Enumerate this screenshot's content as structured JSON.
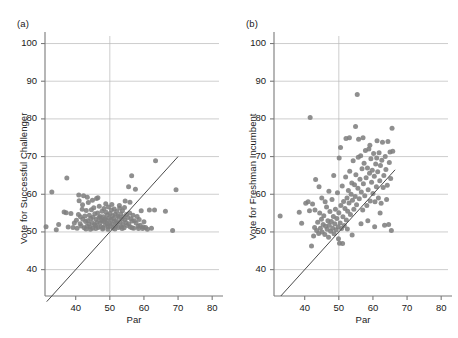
{
  "figure": {
    "background": "#ffffff",
    "marker_color": "#808080",
    "grid_color": "#b9b9b9",
    "axis_color": "#7a7a7a",
    "line_color": "#4a4a4a"
  },
  "panels": [
    {
      "tag": "(a)",
      "chart_data": {
        "type": "scatter",
        "title": "",
        "xlabel": "Par",
        "ylabel": "Vote for Successful Challenger",
        "xlim": [
          31,
          82
        ],
        "ylim": [
          33,
          102
        ],
        "xticks": [
          40,
          50,
          60,
          70,
          80
        ],
        "yticks": [
          40,
          50,
          60,
          70,
          80,
          90,
          100
        ],
        "grid": "horizontal-gridlines-at-yticks plus vertical gridline at x=50",
        "legend": "none",
        "reference_line": {
          "name": "identity-line",
          "equation": "y = x",
          "x_from": 31.5,
          "y_from": 31.5,
          "x_to": 70.0,
          "y_to": 70.0
        },
        "points": [
          [
            31.3,
            51.4
          ],
          [
            33.0,
            60.6
          ],
          [
            34.3,
            50.6
          ],
          [
            36.6,
            55.3
          ],
          [
            37.2,
            55.1
          ],
          [
            37.4,
            64.3
          ],
          [
            38.6,
            54.9
          ],
          [
            39.2,
            51.2
          ],
          [
            39.6,
            52.4
          ],
          [
            40.2,
            53.1
          ],
          [
            40.4,
            51.0
          ],
          [
            40.8,
            54.6
          ],
          [
            41.0,
            58.3
          ],
          [
            41.3,
            52.2
          ],
          [
            41.6,
            51.6
          ],
          [
            41.9,
            56.0
          ],
          [
            42.1,
            53.4
          ],
          [
            42.3,
            59.6
          ],
          [
            42.5,
            51.1
          ],
          [
            42.7,
            54.2
          ],
          [
            42.9,
            52.8
          ],
          [
            43.1,
            55.7
          ],
          [
            43.3,
            51.5
          ],
          [
            43.5,
            53.0
          ],
          [
            43.7,
            57.8
          ],
          [
            43.9,
            52.1
          ],
          [
            44.0,
            54.4
          ],
          [
            44.2,
            51.3
          ],
          [
            44.4,
            53.6
          ],
          [
            44.6,
            55.9
          ],
          [
            44.8,
            52.5
          ],
          [
            45.0,
            51.0
          ],
          [
            45.1,
            53.9
          ],
          [
            45.3,
            56.4
          ],
          [
            45.5,
            52.0
          ],
          [
            45.6,
            54.8
          ],
          [
            45.8,
            51.7
          ],
          [
            46.0,
            53.3
          ],
          [
            46.1,
            58.9
          ],
          [
            46.3,
            52.6
          ],
          [
            46.4,
            55.0
          ],
          [
            46.6,
            51.2
          ],
          [
            46.8,
            53.8
          ],
          [
            46.9,
            56.8
          ],
          [
            47.1,
            52.3
          ],
          [
            47.2,
            54.1
          ],
          [
            47.4,
            51.4
          ],
          [
            47.5,
            53.2
          ],
          [
            47.7,
            55.5
          ],
          [
            47.8,
            52.9
          ],
          [
            48.0,
            51.1
          ],
          [
            48.1,
            54.0
          ],
          [
            48.3,
            56.2
          ],
          [
            48.4,
            52.7
          ],
          [
            48.6,
            53.5
          ],
          [
            48.7,
            51.8
          ],
          [
            48.9,
            55.2
          ],
          [
            49.0,
            53.1
          ],
          [
            49.2,
            52.2
          ],
          [
            49.3,
            54.5
          ],
          [
            49.5,
            51.3
          ],
          [
            49.6,
            56.6
          ],
          [
            49.8,
            53.7
          ],
          [
            49.9,
            52.4
          ],
          [
            50.1,
            54.9
          ],
          [
            50.2,
            51.5
          ],
          [
            50.4,
            53.3
          ],
          [
            50.5,
            55.8
          ],
          [
            50.7,
            52.1
          ],
          [
            50.8,
            54.3
          ],
          [
            51.0,
            51.0
          ],
          [
            51.1,
            53.6
          ],
          [
            51.3,
            56.1
          ],
          [
            51.4,
            52.8
          ],
          [
            51.6,
            54.7
          ],
          [
            51.7,
            51.6
          ],
          [
            51.9,
            53.0
          ],
          [
            52.0,
            55.4
          ],
          [
            52.2,
            52.3
          ],
          [
            52.3,
            54.2
          ],
          [
            52.5,
            51.2
          ],
          [
            52.7,
            53.9
          ],
          [
            52.8,
            57.0
          ],
          [
            53.0,
            52.6
          ],
          [
            53.2,
            54.8
          ],
          [
            53.3,
            51.4
          ],
          [
            53.5,
            53.4
          ],
          [
            53.7,
            55.6
          ],
          [
            53.8,
            52.0
          ],
          [
            54.0,
            54.0
          ],
          [
            54.2,
            51.1
          ],
          [
            54.4,
            53.2
          ],
          [
            54.5,
            58.2
          ],
          [
            54.7,
            52.5
          ],
          [
            54.9,
            54.6
          ],
          [
            55.1,
            51.7
          ],
          [
            55.3,
            53.8
          ],
          [
            55.5,
            62.0
          ],
          [
            55.6,
            52.2
          ],
          [
            55.8,
            55.0
          ],
          [
            56.0,
            51.3
          ],
          [
            56.2,
            53.5
          ],
          [
            56.4,
            64.9
          ],
          [
            56.6,
            52.9
          ],
          [
            56.8,
            54.4
          ],
          [
            57.0,
            51.0
          ],
          [
            57.2,
            53.0
          ],
          [
            57.5,
            61.3
          ],
          [
            57.7,
            52.4
          ],
          [
            58.0,
            54.1
          ],
          [
            58.3,
            51.5
          ],
          [
            58.6,
            53.3
          ],
          [
            58.9,
            51.8
          ],
          [
            59.2,
            55.6
          ],
          [
            59.6,
            50.9
          ],
          [
            60.0,
            52.7
          ],
          [
            60.5,
            51.2
          ],
          [
            61.0,
            50.7
          ],
          [
            61.6,
            55.8
          ],
          [
            62.2,
            51.0
          ],
          [
            63.1,
            55.8
          ],
          [
            63.4,
            68.9
          ],
          [
            66.3,
            55.5
          ],
          [
            68.4,
            50.4
          ],
          [
            69.4,
            61.2
          ],
          [
            35.0,
            52.0
          ],
          [
            37.8,
            51.3
          ],
          [
            40.9,
            59.8
          ],
          [
            42.0,
            57.2
          ],
          [
            43.4,
            59.2
          ],
          [
            44.9,
            58.4
          ],
          [
            46.5,
            59.1
          ],
          [
            48.8,
            57.5
          ],
          [
            50.6,
            57.3
          ],
          [
            52.9,
            56.3
          ],
          [
            54.3,
            56.5
          ],
          [
            55.9,
            57.9
          ],
          [
            41.4,
            54.0
          ],
          [
            45.9,
            50.9
          ],
          [
            47.9,
            50.8
          ],
          [
            49.4,
            50.7
          ],
          [
            51.5,
            50.8
          ],
          [
            53.6,
            50.9
          ],
          [
            56.5,
            51.1
          ],
          [
            58.4,
            50.9
          ],
          [
            59.8,
            51.3
          ],
          [
            43.0,
            50.8
          ],
          [
            44.3,
            50.7
          ]
        ]
      }
    },
    {
      "tag": "(b)",
      "chart_data": {
        "type": "scatter",
        "title": "",
        "xlabel": "Par",
        "ylabel": "Vote for Freshman Incumbent",
        "xlim": [
          31,
          82
        ],
        "ylim": [
          33,
          102
        ],
        "xticks": [
          40,
          50,
          60,
          70,
          80
        ],
        "yticks": [
          40,
          50,
          60,
          70,
          80,
          90,
          100
        ],
        "grid": "horizontal-gridlines-at-yticks plus vertical gridline at x=50",
        "legend": "none",
        "reference_line": {
          "name": "identity-line",
          "equation": "y = x",
          "x_from": 33.0,
          "y_from": 33.0,
          "x_to": 66.5,
          "y_to": 66.5
        },
        "points": [
          [
            32.8,
            54.2
          ],
          [
            38.4,
            55.2
          ],
          [
            39.1,
            52.3
          ],
          [
            40.3,
            57.6
          ],
          [
            41.0,
            58.0
          ],
          [
            41.6,
            80.4
          ],
          [
            42.0,
            46.3
          ],
          [
            42.3,
            57.4
          ],
          [
            42.6,
            48.9
          ],
          [
            42.9,
            51.2
          ],
          [
            43.2,
            63.9
          ],
          [
            43.5,
            50.4
          ],
          [
            43.8,
            52.6
          ],
          [
            44.1,
            49.6
          ],
          [
            44.4,
            55.0
          ],
          [
            44.6,
            51.0
          ],
          [
            44.9,
            53.4
          ],
          [
            45.1,
            50.0
          ],
          [
            45.4,
            52.0
          ],
          [
            45.6,
            54.3
          ],
          [
            45.9,
            49.3
          ],
          [
            46.1,
            51.5
          ],
          [
            46.4,
            56.6
          ],
          [
            46.6,
            50.7
          ],
          [
            46.8,
            53.0
          ],
          [
            47.0,
            48.6
          ],
          [
            47.2,
            51.8
          ],
          [
            47.4,
            55.4
          ],
          [
            47.6,
            50.2
          ],
          [
            47.8,
            52.8
          ],
          [
            48.0,
            58.6
          ],
          [
            48.2,
            51.0
          ],
          [
            48.4,
            54.1
          ],
          [
            48.6,
            49.5
          ],
          [
            48.8,
            52.2
          ],
          [
            49.0,
            56.0
          ],
          [
            49.2,
            50.6
          ],
          [
            49.4,
            53.6
          ],
          [
            49.6,
            60.4
          ],
          [
            49.8,
            51.4
          ],
          [
            50.0,
            55.1
          ],
          [
            50.2,
            47.0
          ],
          [
            50.4,
            52.4
          ],
          [
            50.6,
            57.0
          ],
          [
            50.8,
            50.9
          ],
          [
            51.0,
            62.2
          ],
          [
            51.2,
            54.0
          ],
          [
            51.4,
            58.1
          ],
          [
            51.6,
            51.7
          ],
          [
            51.8,
            56.2
          ],
          [
            52.0,
            64.6
          ],
          [
            52.2,
            53.2
          ],
          [
            52.4,
            59.0
          ],
          [
            52.6,
            55.5
          ],
          [
            52.8,
            61.0
          ],
          [
            53.0,
            57.7
          ],
          [
            53.2,
            66.1
          ],
          [
            53.4,
            54.6
          ],
          [
            53.6,
            60.0
          ],
          [
            53.8,
            63.0
          ],
          [
            54.0,
            58.4
          ],
          [
            54.2,
            68.9
          ],
          [
            54.4,
            56.0
          ],
          [
            54.6,
            62.5
          ],
          [
            54.8,
            59.4
          ],
          [
            55.0,
            65.2
          ],
          [
            55.2,
            57.2
          ],
          [
            55.4,
            86.5
          ],
          [
            55.6,
            61.6
          ],
          [
            55.8,
            74.6
          ],
          [
            56.0,
            58.8
          ],
          [
            56.2,
            64.0
          ],
          [
            56.4,
            70.2
          ],
          [
            56.6,
            60.6
          ],
          [
            56.8,
            66.8
          ],
          [
            57.0,
            55.8
          ],
          [
            57.2,
            62.8
          ],
          [
            57.4,
            68.2
          ],
          [
            57.6,
            59.6
          ],
          [
            57.8,
            71.6
          ],
          [
            58.0,
            64.4
          ],
          [
            58.2,
            57.0
          ],
          [
            58.4,
            67.0
          ],
          [
            58.6,
            61.2
          ],
          [
            58.8,
            72.0
          ],
          [
            59.0,
            65.6
          ],
          [
            59.2,
            58.2
          ],
          [
            59.4,
            69.4
          ],
          [
            59.6,
            63.2
          ],
          [
            59.8,
            66.4
          ],
          [
            60.0,
            60.2
          ],
          [
            60.2,
            70.8
          ],
          [
            60.4,
            64.8
          ],
          [
            60.6,
            58.0
          ],
          [
            60.8,
            68.0
          ],
          [
            61.0,
            62.0
          ],
          [
            61.2,
            74.2
          ],
          [
            61.4,
            66.0
          ],
          [
            61.6,
            59.0
          ],
          [
            61.8,
            71.0
          ],
          [
            62.0,
            63.6
          ],
          [
            62.2,
            67.6
          ],
          [
            62.4,
            57.6
          ],
          [
            62.6,
            69.0
          ],
          [
            62.8,
            73.8
          ],
          [
            63.0,
            61.8
          ],
          [
            63.2,
            65.0
          ],
          [
            63.4,
            51.8
          ],
          [
            63.6,
            70.0
          ],
          [
            63.8,
            66.6
          ],
          [
            64.0,
            58.6
          ],
          [
            64.2,
            62.4
          ],
          [
            64.4,
            74.0
          ],
          [
            64.6,
            52.0
          ],
          [
            64.8,
            68.4
          ],
          [
            65.0,
            71.2
          ],
          [
            65.2,
            64.2
          ],
          [
            65.4,
            50.4
          ],
          [
            65.6,
            77.5
          ],
          [
            65.8,
            71.4
          ],
          [
            54.9,
            78.0
          ],
          [
            50.1,
            69.6
          ],
          [
            48.5,
            65.0
          ],
          [
            47.1,
            60.8
          ],
          [
            45.0,
            59.0
          ],
          [
            43.0,
            55.8
          ],
          [
            52.5,
            50.8
          ],
          [
            53.9,
            49.2
          ],
          [
            51.1,
            46.9
          ],
          [
            49.9,
            48.2
          ],
          [
            56.5,
            52.2
          ],
          [
            58.5,
            53.0
          ],
          [
            60.5,
            51.4
          ],
          [
            62.1,
            55.0
          ],
          [
            50.5,
            72.4
          ],
          [
            52.1,
            74.8
          ],
          [
            53.1,
            75.0
          ],
          [
            55.7,
            69.8
          ],
          [
            57.1,
            75.0
          ],
          [
            59.1,
            73.0
          ],
          [
            61.1,
            69.6
          ],
          [
            44.2,
            62.0
          ],
          [
            46.0,
            58.0
          ],
          [
            41.4,
            55.6
          ]
        ]
      }
    }
  ]
}
